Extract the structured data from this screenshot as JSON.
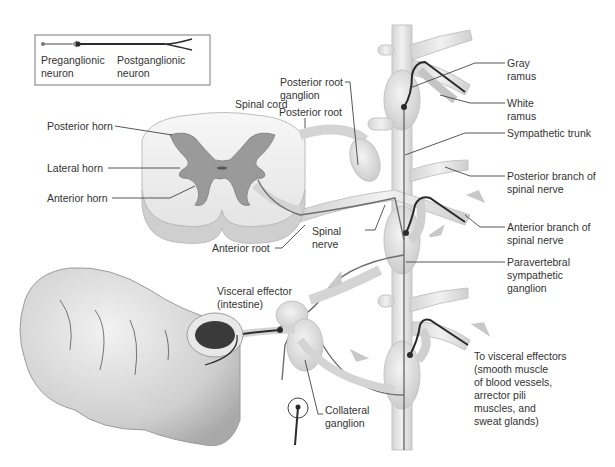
{
  "legend": {
    "preganglionic": "Preganglionic\nneuron",
    "postganglionic": "Postganglionic\nneuron"
  },
  "labels": {
    "spinal_cord": "Spinal cord",
    "posterior_horn": "Posterior horn",
    "lateral_horn": "Lateral horn",
    "anterior_horn": "Anterior horn",
    "posterior_root_ganglion": "Posterior root\nganglion",
    "posterior_root": "Posterior root",
    "anterior_root": "Anterior root",
    "spinal_nerve": "Spinal\nnerve",
    "gray_ramus": "Gray\nramus",
    "white_ramus": "White\nramus",
    "sympathetic_trunk": "Sympathetic trunk",
    "posterior_branch": "Posterior branch of\nspinal nerve",
    "anterior_branch": "Anterior branch of\nspinal nerve",
    "paravertebral_ganglion": "Paravertebral\nsympathetic\nganglion",
    "visceral_effector": "Visceral effector\n(intestine)",
    "collateral_ganglion": "Collateral\nganglion",
    "to_visceral_effectors": "To visceral effectors\n(smooth muscle\nof blood vessels,\narrector pili\nmuscles, and\nsweat glands)"
  },
  "colors": {
    "tissue": "#e6e6e6",
    "tissue_edge": "#bdbdbd",
    "gray_matter": "#9a9a9a",
    "preganglionic_line": "#6e6e6e",
    "postganglionic_line": "#2b2b2b",
    "arrow": "#c8c8c8",
    "leader": "#444444"
  }
}
